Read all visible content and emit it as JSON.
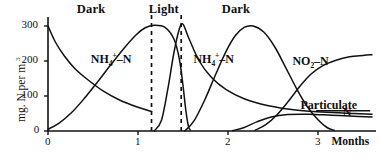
{
  "chart_data": {
    "type": "line",
    "title": "",
    "xlabel": "Months",
    "ylabel": "mg. N per m.3",
    "ylabel_parts": {
      "pre": "mg. N per m.",
      "sup": "3"
    },
    "xlim": [
      0,
      3.6
    ],
    "ylim": [
      0,
      320
    ],
    "x_ticks": [
      "0",
      "1",
      "2",
      "3"
    ],
    "x_tick_values": [
      0,
      1,
      2,
      3
    ],
    "y_ticks": [
      "0",
      "100",
      "200",
      "300"
    ],
    "y_tick_values": [
      0,
      100,
      200,
      300
    ],
    "grid": false,
    "legend": "inline-annotations",
    "period_bands": [
      {
        "label": "Dark",
        "from": 0.0,
        "to": 1.15,
        "label_x": 0.52
      },
      {
        "label": "Light",
        "from": 1.15,
        "to": 1.48,
        "label_x": 1.32
      },
      {
        "label": "Dark",
        "from": 1.48,
        "to": 3.6,
        "label_x": 2.13
      }
    ],
    "dashed_dividers": [
      1.15,
      1.48
    ],
    "annotations": [
      {
        "text": "NH4+-N",
        "html": "NH<sub>4</sub><sup>+</sup>–N",
        "x": 0.72,
        "y": 205
      },
      {
        "text": "NH4+-N",
        "html": "NH<sub>4</sub><sup>+</sup>–N",
        "x": 1.86,
        "y": 205
      },
      {
        "text": "NO2-N",
        "html": "NO<sub>2</sub>–N",
        "x": 2.96,
        "y": 198
      },
      {
        "text": "Particulate N",
        "html": "Particulate",
        "x": 3.05,
        "y": 72
      },
      {
        "text": "N",
        "html": "N",
        "x": 3.52,
        "y": 52
      }
    ],
    "series": [
      {
        "name": "NO3-N initial decay",
        "points": [
          [
            0,
            300
          ],
          [
            0.08,
            255
          ],
          [
            0.18,
            215
          ],
          [
            0.3,
            178
          ],
          [
            0.45,
            145
          ],
          [
            0.62,
            113
          ],
          [
            0.8,
            88
          ],
          [
            1.0,
            68
          ],
          [
            1.15,
            56
          ]
        ]
      },
      {
        "name": "NH4+-N first dark rise",
        "points": [
          [
            0,
            5
          ],
          [
            0.12,
            22
          ],
          [
            0.26,
            52
          ],
          [
            0.4,
            92
          ],
          [
            0.55,
            140
          ],
          [
            0.7,
            190
          ],
          [
            0.85,
            238
          ],
          [
            0.98,
            275
          ],
          [
            1.08,
            295
          ],
          [
            1.18,
            302
          ],
          [
            1.3,
            296
          ],
          [
            1.4,
            262
          ],
          [
            1.46,
            205
          ],
          [
            1.5,
            130
          ],
          [
            1.53,
            62
          ],
          [
            1.56,
            14
          ],
          [
            1.58,
            3
          ]
        ]
      },
      {
        "name": "Light spike",
        "points": [
          [
            1.18,
            0
          ],
          [
            1.26,
            30
          ],
          [
            1.33,
            118
          ],
          [
            1.4,
            225
          ],
          [
            1.46,
            292
          ],
          [
            1.5,
            305
          ],
          [
            1.56,
            268
          ],
          [
            1.68,
            200
          ],
          [
            1.82,
            152
          ],
          [
            1.98,
            118
          ],
          [
            2.18,
            92
          ],
          [
            2.45,
            72
          ],
          [
            2.75,
            60
          ],
          [
            3.05,
            54
          ],
          [
            3.4,
            50
          ],
          [
            3.6,
            48
          ]
        ]
      },
      {
        "name": "NH4+-N second dark hump",
        "points": [
          [
            1.52,
            0
          ],
          [
            1.62,
            28
          ],
          [
            1.74,
            88
          ],
          [
            1.86,
            160
          ],
          [
            1.98,
            228
          ],
          [
            2.08,
            272
          ],
          [
            2.18,
            296
          ],
          [
            2.28,
            300
          ],
          [
            2.4,
            282
          ],
          [
            2.52,
            240
          ],
          [
            2.64,
            182
          ],
          [
            2.76,
            122
          ],
          [
            2.88,
            70
          ],
          [
            3.0,
            32
          ],
          [
            3.1,
            10
          ],
          [
            3.18,
            2
          ]
        ]
      },
      {
        "name": "NO2-N rise",
        "points": [
          [
            2.3,
            2
          ],
          [
            2.42,
            18
          ],
          [
            2.55,
            48
          ],
          [
            2.68,
            88
          ],
          [
            2.8,
            128
          ],
          [
            2.92,
            162
          ],
          [
            3.05,
            186
          ],
          [
            3.2,
            202
          ],
          [
            3.35,
            212
          ],
          [
            3.5,
            216
          ],
          [
            3.6,
            218
          ]
        ]
      },
      {
        "name": "Particulate N",
        "points": [
          [
            2.05,
            1
          ],
          [
            2.18,
            10
          ],
          [
            2.32,
            26
          ],
          [
            2.48,
            40
          ],
          [
            2.66,
            47
          ],
          [
            2.9,
            48
          ],
          [
            3.15,
            45
          ],
          [
            3.4,
            42
          ],
          [
            3.6,
            40
          ]
        ]
      }
    ]
  }
}
